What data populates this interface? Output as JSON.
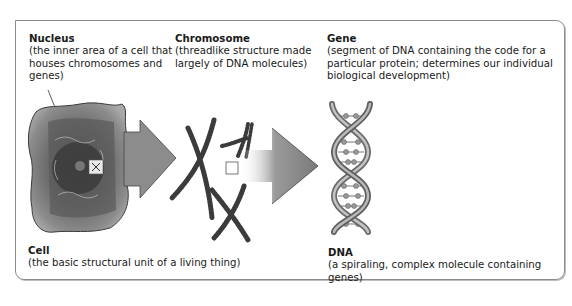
{
  "diagram": {
    "nodes": [
      {
        "id": "nucleus",
        "title": "Nucleus",
        "description": "(the inner area of a cell that houses chromosomes and genes)"
      },
      {
        "id": "chromosome",
        "title": "Chromosome",
        "description": "(threadlike structure made largely of DNA molecules)"
      },
      {
        "id": "gene",
        "title": "Gene",
        "description": "(segment of DNA containing the code for a particular protein; determines our individual biological development)"
      },
      {
        "id": "cell",
        "title": "Cell",
        "description": "(the basic structural unit of a living thing)"
      },
      {
        "id": "dna",
        "title": "DNA",
        "description": "(a spiraling, complex molecule containing genes)"
      }
    ],
    "flow": [
      "cell",
      "chromosome",
      "dna"
    ],
    "icons": {
      "cell": "cell-illustration-icon",
      "chromosome": "chromosome-illustration-icon",
      "dna": "dna-double-helix-icon",
      "arrow": "right-arrow-icon"
    },
    "colors": {
      "frame": "#8a8a8a",
      "arrow": "#8c8c8c",
      "text": "#1a1a1a"
    }
  }
}
